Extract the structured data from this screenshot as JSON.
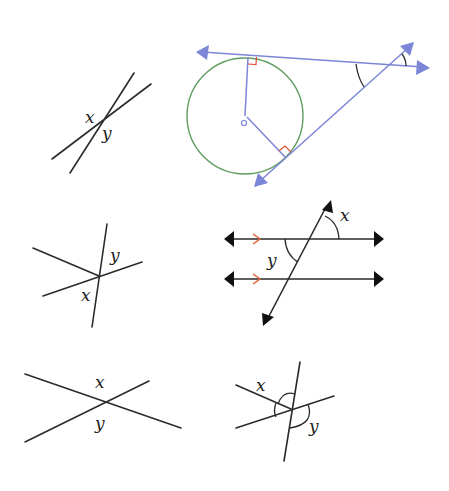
{
  "diagrams": [
    {
      "id": "vertical-angles-narrow",
      "labels": {
        "x": "x",
        "y": "y"
      }
    },
    {
      "id": "circle-tangents",
      "colors": {
        "lines": "#7b86d6",
        "circle": "#5f9e5f",
        "right_angle": "#e0503a"
      }
    },
    {
      "id": "star-lines",
      "labels": {
        "x": "x",
        "y": "y"
      }
    },
    {
      "id": "parallel-transversal",
      "labels": {
        "x": "x",
        "y": "y"
      },
      "colors": {
        "parallel_marks": "#e0603a"
      }
    },
    {
      "id": "vertical-angles-wide",
      "labels": {
        "x": "x",
        "y": "y"
      }
    },
    {
      "id": "three-lines-arcs",
      "labels": {
        "x": "x",
        "y": "y"
      }
    }
  ]
}
